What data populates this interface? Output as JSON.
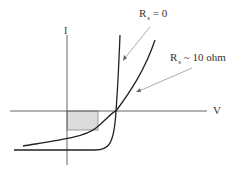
{
  "diagram": {
    "type": "IV-curve",
    "axes": {
      "x_label": "V",
      "y_label": "I"
    },
    "curves": [
      {
        "name": "ideal",
        "label_main": "R",
        "label_sub": "s",
        "label_rest": " = 0"
      },
      {
        "name": "series-resistance",
        "label_main": "R",
        "label_sub": "s",
        "label_rest": " ~ 10 ohm"
      }
    ],
    "shaded_region": {
      "fill": "#dcdcdc",
      "stroke": "#888888"
    },
    "colors": {
      "axis": "#555555",
      "curve": "#222222",
      "arrow": "#888888"
    }
  }
}
